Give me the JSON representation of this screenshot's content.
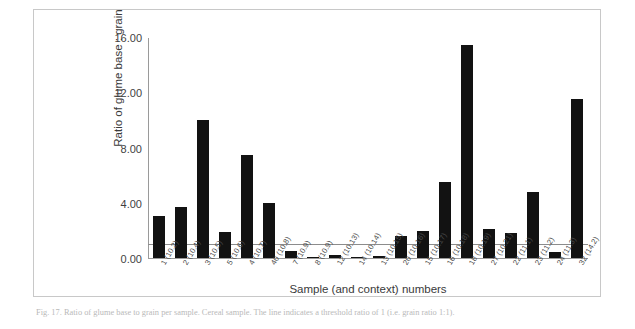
{
  "figure": {
    "caption": "Fig. 17. Ratio of glume base to grain per sample. Cereal sample. The line indicates a threshold ratio of 1 (i.e. grain ratio 1:1)."
  },
  "chart_data": {
    "type": "bar",
    "title": "",
    "xlabel": "Sample (and context) numbers",
    "ylabel": "Ratio of glume base : grain",
    "ylim": [
      0,
      16
    ],
    "yticks": [
      0,
      4,
      8,
      12,
      16
    ],
    "ytick_labels": [
      "0.00",
      "4.00",
      "8.00",
      "12.00",
      "16.00"
    ],
    "grid": false,
    "legend": false,
    "bar_color": "#121212",
    "axis_color": "#9a9a9a",
    "threshold_line": {
      "value": 1.0,
      "color": "#8c8c8c",
      "label": ""
    },
    "categories": [
      "1 (10.2)",
      "2 (10.4)",
      "3 (10.5)",
      "5 (10.6)",
      "4 (10.7)",
      "40 (10.8)",
      "7 (10.9)",
      "8 (10.9)",
      "12 (10.13)",
      "14 (10.14)",
      "13 (10.15)",
      "20 (10.16)",
      "15 (10.17)",
      "16 (10.18)",
      "18 (10.19)",
      "27 (10.21)",
      "22 (11.1)",
      "23 (11.2)",
      "24 (11.3)",
      "32 (14.2)"
    ],
    "values": [
      3.05,
      3.7,
      10.0,
      1.9,
      7.45,
      3.95,
      0.52,
      0.05,
      0.2,
      0.1,
      0.15,
      1.6,
      1.95,
      5.5,
      15.4,
      2.1,
      1.8,
      4.8,
      0.4,
      11.5
    ]
  }
}
